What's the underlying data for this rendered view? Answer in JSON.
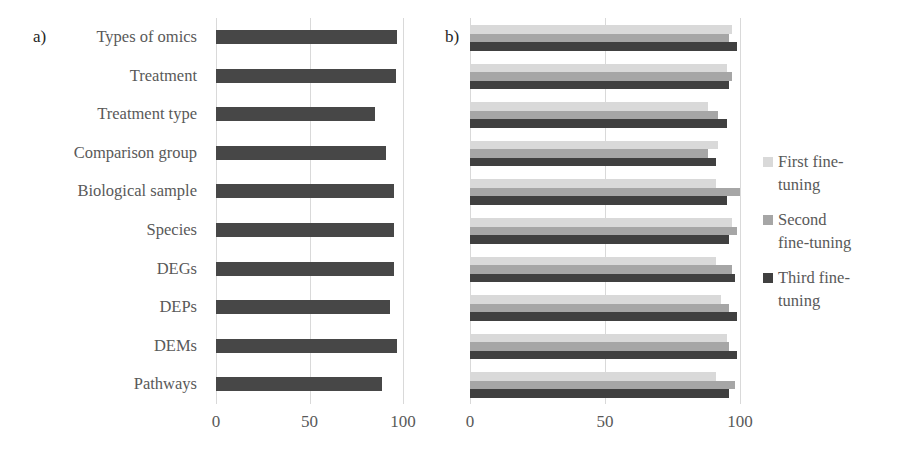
{
  "panels": {
    "a_label": "a)",
    "b_label": "b)"
  },
  "categories": [
    "Types of omics",
    "Treatment",
    "Treatment type",
    "Comparison group",
    "Biological sample",
    "Species",
    "DEGs",
    "DEPs",
    "DEMs",
    "Pathways"
  ],
  "ticks": [
    "0",
    "50",
    "100"
  ],
  "legend": [
    {
      "label_line1": "First fine-",
      "label_line2": "tuning",
      "color": "#d9d9d9"
    },
    {
      "label_line1": "Second",
      "label_line2": "fine-tuning",
      "color": "#a6a6a6"
    },
    {
      "label_line1": "Third fine-",
      "label_line2": "tuning",
      "color": "#404040"
    }
  ],
  "colors": {
    "panel_a_bar": "#474747",
    "grid": "#d9d9d9"
  },
  "chart_data": [
    {
      "type": "bar",
      "orientation": "horizontal",
      "title": "a)",
      "categories": [
        "Types of omics",
        "Treatment",
        "Treatment type",
        "Comparison group",
        "Biological sample",
        "Species",
        "DEGs",
        "DEPs",
        "DEMs",
        "Pathways"
      ],
      "values": [
        97,
        96,
        85,
        91,
        95,
        95,
        95,
        93,
        97,
        89
      ],
      "xlabel": "",
      "ylabel": "",
      "xlim": [
        0,
        100
      ],
      "xticks": [
        0,
        50,
        100
      ],
      "grid": true,
      "legend": null
    },
    {
      "type": "bar",
      "orientation": "horizontal",
      "title": "b)",
      "categories": [
        "Types of omics",
        "Treatment",
        "Treatment type",
        "Comparison group",
        "Biological sample",
        "Species",
        "DEGs",
        "DEPs",
        "DEMs",
        "Pathways"
      ],
      "series": [
        {
          "name": "First fine-tuning",
          "color": "#d9d9d9",
          "values": [
            97,
            95,
            88,
            92,
            91,
            97,
            91,
            93,
            95,
            91
          ]
        },
        {
          "name": "Second fine-tuning",
          "color": "#a6a6a6",
          "values": [
            96,
            97,
            92,
            88,
            100,
            99,
            97,
            96,
            96,
            98
          ]
        },
        {
          "name": "Third fine-tuning",
          "color": "#404040",
          "values": [
            99,
            96,
            95,
            91,
            95,
            96,
            98,
            99,
            99,
            96
          ]
        }
      ],
      "xlabel": "",
      "ylabel": "",
      "xlim": [
        0,
        100
      ],
      "xticks": [
        0,
        50,
        100
      ],
      "grid": true,
      "legend_position": "right"
    }
  ]
}
